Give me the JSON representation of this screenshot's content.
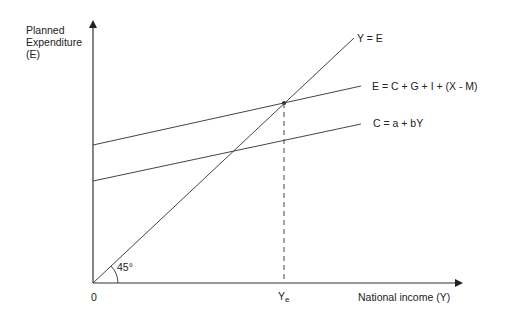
{
  "axes": {
    "y_label_lines": [
      "Planned",
      "Expenditure",
      "(E)"
    ],
    "x_label": "National  income (Y)",
    "origin_label": "0",
    "equilibrium_label_main": "Y",
    "equilibrium_label_sub": "e",
    "angle_label": "45°"
  },
  "lines": [
    {
      "name": "forty-five-degree-line",
      "label": "Y = E"
    },
    {
      "name": "aggregate-expenditure-line",
      "label": "E = C + G + I + (X - M)"
    },
    {
      "name": "consumption-line",
      "label": "C = a + bY"
    }
  ],
  "colors": {
    "line": "#333333",
    "axis": "#333333",
    "background": "#ffffff"
  }
}
